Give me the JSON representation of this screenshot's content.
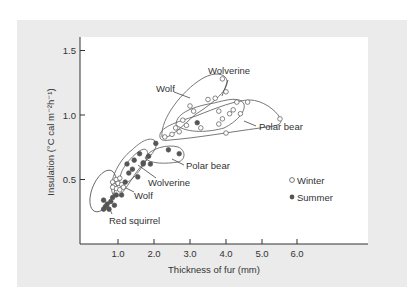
{
  "chart_data": {
    "type": "scatter",
    "title": "",
    "xlabel": "Thickness of fur (mm)",
    "ylabel": "Insulation (°C cal m⁻² h⁻¹)",
    "xlim": [
      0,
      8
    ],
    "ylim": [
      0,
      1.5
    ],
    "xticks": [
      1.0,
      2.0,
      3.0,
      4.0,
      5.0,
      6.0
    ],
    "xtick_labels": [
      "1.0",
      "2.0",
      "3.0",
      "4.0",
      "5.0",
      "6.0"
    ],
    "yticks": [
      0.5,
      1.0,
      1.5
    ],
    "ytick_labels": [
      "0.5",
      "1.0",
      "1.5"
    ],
    "grid": false,
    "legend": {
      "position": "right-middle",
      "entries": [
        {
          "label": "Winter",
          "marker": "open-circle"
        },
        {
          "label": "Summer",
          "marker": "filled-circle"
        }
      ]
    },
    "series": [
      {
        "name": "Winter",
        "marker": "open-circle",
        "points": [
          [
            0.95,
            0.5
          ],
          [
            1.05,
            0.51
          ],
          [
            0.85,
            0.48
          ],
          [
            1.0,
            0.47
          ],
          [
            0.9,
            0.45
          ],
          [
            1.1,
            0.46
          ],
          [
            0.95,
            0.43
          ],
          [
            1.05,
            0.42
          ],
          [
            1.15,
            0.44
          ],
          [
            0.85,
            0.44
          ],
          [
            2.3,
            0.83
          ],
          [
            2.5,
            0.85
          ],
          [
            2.7,
            0.87
          ],
          [
            2.6,
            0.9
          ],
          [
            2.9,
            0.92
          ],
          [
            3.3,
            0.9
          ],
          [
            2.8,
            0.96
          ],
          [
            3.1,
            1.03
          ],
          [
            3.5,
            1.12
          ],
          [
            3.7,
            1.13
          ],
          [
            3.0,
            1.07
          ],
          [
            3.9,
            1.28
          ],
          [
            4.0,
            1.18
          ],
          [
            3.8,
            1.03
          ],
          [
            3.8,
            0.93
          ],
          [
            3.9,
            0.97
          ],
          [
            4.1,
            1.01
          ],
          [
            4.2,
            1.04
          ],
          [
            4.4,
            1.01
          ],
          [
            4.3,
            1.1
          ],
          [
            4.6,
            1.1
          ],
          [
            4.0,
            0.86
          ],
          [
            5.5,
            0.97
          ]
        ]
      },
      {
        "name": "Summer",
        "marker": "filled-circle",
        "points": [
          [
            0.6,
            0.34
          ],
          [
            0.7,
            0.31
          ],
          [
            0.8,
            0.33
          ],
          [
            0.65,
            0.29
          ],
          [
            0.75,
            0.27
          ],
          [
            0.9,
            0.3
          ],
          [
            0.85,
            0.36
          ],
          [
            0.95,
            0.38
          ],
          [
            0.6,
            0.27
          ],
          [
            1.1,
            0.38
          ],
          [
            1.2,
            0.48
          ],
          [
            1.3,
            0.55
          ],
          [
            1.4,
            0.58
          ],
          [
            1.55,
            0.52
          ],
          [
            1.25,
            0.62
          ],
          [
            1.45,
            0.65
          ],
          [
            1.6,
            0.7
          ],
          [
            1.7,
            0.62
          ],
          [
            1.85,
            0.68
          ],
          [
            2.05,
            0.78
          ],
          [
            1.7,
            0.63
          ],
          [
            1.9,
            0.62
          ],
          [
            2.4,
            0.73
          ],
          [
            2.7,
            0.7
          ],
          [
            3.2,
            0.94
          ]
        ]
      }
    ],
    "groups": [
      {
        "label": "Wolf",
        "season": "Winter"
      },
      {
        "label": "Wolverine",
        "season": "Winter"
      },
      {
        "label": "Polar bear",
        "season": "Winter"
      },
      {
        "label": "Polar bear",
        "season": "Summer"
      },
      {
        "label": "Wolverine",
        "season": "Summer"
      },
      {
        "label": "Wolf",
        "season": "Summer"
      },
      {
        "label": "Red squirrel",
        "season": "Winter/Summer"
      }
    ],
    "annotations": [
      "Wolf",
      "Wolverine",
      "Polar bear",
      "Polar bear",
      "Wolverine",
      "Wolf",
      "Red squirrel"
    ]
  },
  "labels": {
    "xlabel": "Thickness of fur (mm)",
    "ylabel": "Insulation (°C cal m⁻²h⁻¹)",
    "legend_winter": "Winter",
    "legend_summer": "Summer",
    "wolf_winter": "Wolf",
    "wolverine_winter": "Wolverine",
    "polarbear_winter": "Polar bear",
    "polarbear_summer": "Polar bear",
    "wolverine_summer": "Wolverine",
    "wolf_summer": "Wolf",
    "red_squirrel": "Red squirrel",
    "xt": [
      "1.0",
      "2.0",
      "3.0",
      "4.0",
      "5.0",
      "6.0"
    ],
    "yt": [
      "0.5",
      "1.0",
      "1.5"
    ]
  }
}
